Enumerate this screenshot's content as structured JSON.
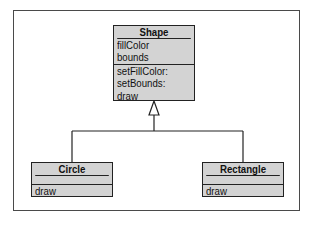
{
  "diagram": {
    "type": "uml-class-diagram",
    "classes": [
      {
        "name": "Shape",
        "attributes": [
          "fillColor",
          "bounds"
        ],
        "methods": [
          "setFillColor:",
          "setBounds:",
          "draw"
        ]
      },
      {
        "name": "Circle",
        "attributes": [],
        "methods": [
          "draw"
        ]
      },
      {
        "name": "Rectangle",
        "attributes": [],
        "methods": [
          "draw"
        ]
      }
    ],
    "relationships": [
      {
        "type": "generalization",
        "from": "Circle",
        "to": "Shape"
      },
      {
        "type": "generalization",
        "from": "Rectangle",
        "to": "Shape"
      }
    ]
  },
  "colors": {
    "class_fill": "#d3d3d3",
    "stroke": "#222222",
    "frame": "#4a4a4a"
  }
}
